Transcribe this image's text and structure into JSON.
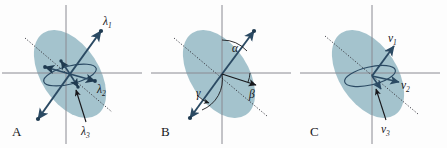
{
  "figure": {
    "background_color": "#fdfdfd",
    "ellipse_fill_color": "#9fc0ca",
    "axis_color": "#8a8a92",
    "vector_color": "#2b4a63",
    "dotted_line_color": "#3a3a42",
    "label_color": "#17171b"
  },
  "panels": [
    {
      "id": "A",
      "letter": "A",
      "labels": [
        {
          "name": "lambda-1",
          "base": "λ",
          "sub": "1"
        },
        {
          "name": "lambda-2",
          "base": "λ",
          "sub": "2"
        },
        {
          "name": "lambda-3",
          "base": "λ",
          "sub": "3"
        }
      ]
    },
    {
      "id": "B",
      "letter": "B",
      "labels": [
        {
          "name": "alpha",
          "base": "α",
          "sub": ""
        },
        {
          "name": "beta",
          "base": "β",
          "sub": ""
        },
        {
          "name": "gamma",
          "base": "γ",
          "sub": ""
        }
      ]
    },
    {
      "id": "C",
      "letter": "C",
      "labels": [
        {
          "name": "v-1",
          "base": "v",
          "sub": "1"
        },
        {
          "name": "v-2",
          "base": "v",
          "sub": "2"
        },
        {
          "name": "v-3",
          "base": "v",
          "sub": "3"
        }
      ]
    }
  ]
}
